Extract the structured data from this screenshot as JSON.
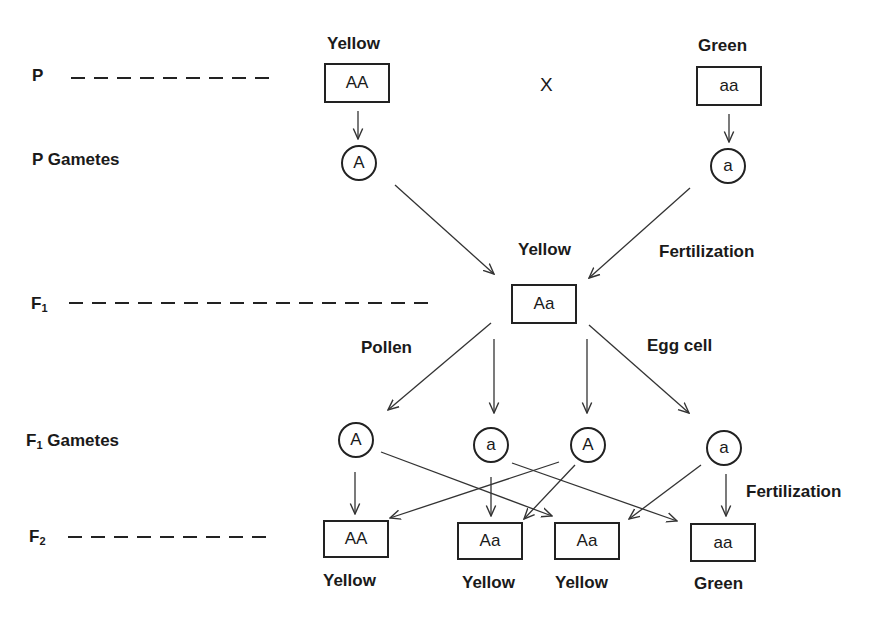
{
  "rows": {
    "p": {
      "label": "P"
    },
    "p_gametes": {
      "label": "P Gametes"
    },
    "f1": {
      "label": "F",
      "sub": "1"
    },
    "f1_gametes": {
      "label": "F",
      "sub": "1",
      "suffix": " Gametes"
    },
    "f2": {
      "label": "F",
      "sub": "2"
    }
  },
  "parents": {
    "left": {
      "phenotype": "Yellow",
      "genotype": "AA",
      "gamete": "A"
    },
    "right": {
      "phenotype": "Green",
      "genotype": "aa",
      "gamete": "a"
    },
    "cross_symbol": "X"
  },
  "f1": {
    "phenotype": "Yellow",
    "genotype": "Aa",
    "fertilization_label": "Fertilization"
  },
  "f1_gametes": {
    "pollen_label": "Pollen",
    "egg_label": "Egg cell",
    "items": [
      "A",
      "a",
      "A",
      "a"
    ]
  },
  "f2": {
    "fertilization_label": "Fertilization",
    "offspring": [
      {
        "genotype": "AA",
        "phenotype": "Yellow"
      },
      {
        "genotype": "Aa",
        "phenotype": "Yellow"
      },
      {
        "genotype": "Aa",
        "phenotype": "Yellow"
      },
      {
        "genotype": "aa",
        "phenotype": "Green"
      }
    ]
  },
  "colors": {
    "stroke": "#222222",
    "text": "#1a1a1a",
    "background": "#ffffff"
  }
}
